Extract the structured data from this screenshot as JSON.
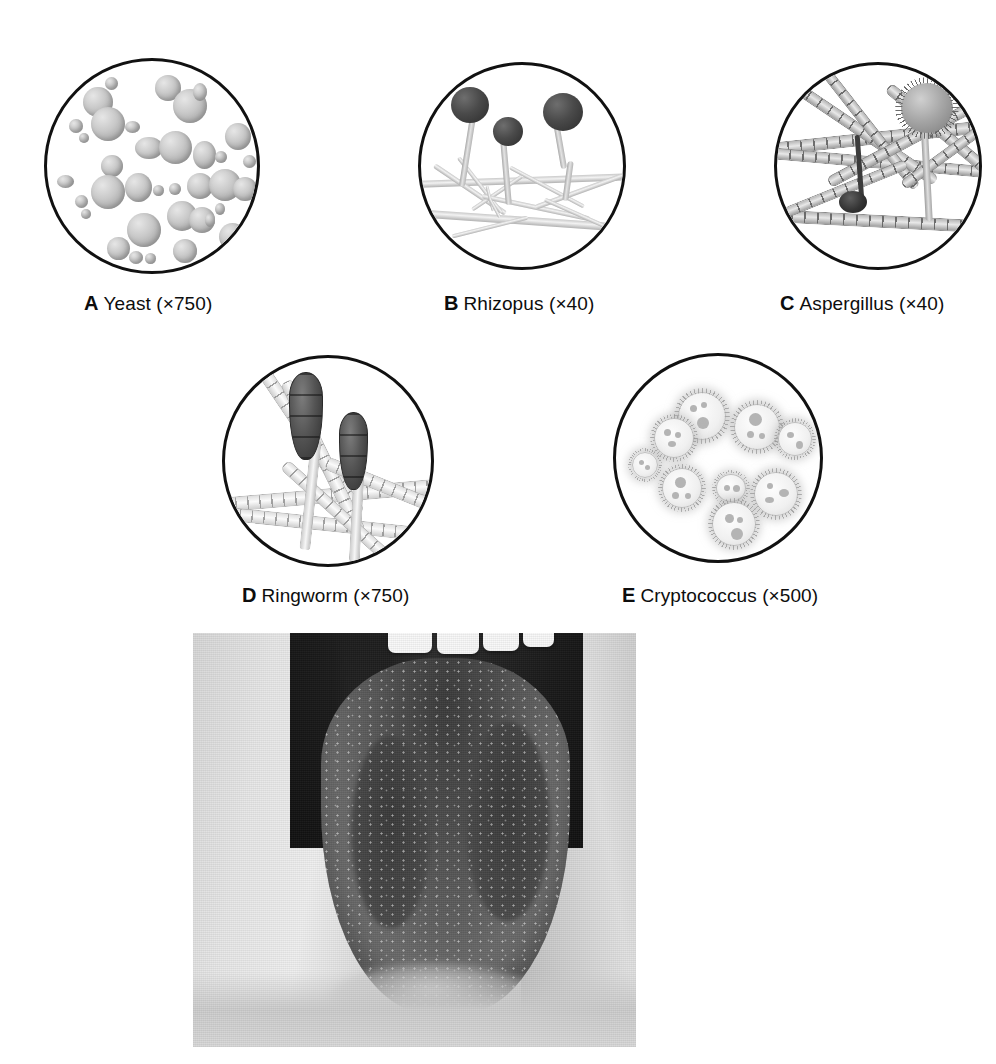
{
  "figure": {
    "kind": "medical-microbiology-plate",
    "panels": [
      {
        "id": "A",
        "tag": "A",
        "name": "Yeast",
        "magnification": "(×750)",
        "subject": "budding-yeast-cells",
        "description": "Round to ovoid grey yeast cells of varied size scattered on a pale field, several joined as budding pairs.",
        "icon": "microscope-field-icon"
      },
      {
        "id": "B",
        "tag": "B",
        "name": "Rhizopus",
        "magnification": "(×40)",
        "subject": "sporangia-on-sporangiophores",
        "description": "Three dark round sporangia borne on upright sporangiophores arising from horizontal stolons with branching rhizoids.",
        "icon": "microscope-field-icon"
      },
      {
        "id": "C",
        "tag": "C",
        "name": "Aspergillus",
        "magnification": "(×40)",
        "subject": "septate-hyphae-with-conidial-head",
        "description": "Interwoven septate (segmented) hyphae with a spiky radiate conidial head on a conidiophore at upper right and a small dark conidium at centre.",
        "icon": "microscope-field-icon"
      },
      {
        "id": "D",
        "tag": "D",
        "name": "Ringworm",
        "magnification": "(×750)",
        "subject": "macroconidia-on-hyphae",
        "description": "Two dark club-shaped multicellular macroconidia on slender stalks rising from pale septate hyphae.",
        "icon": "microscope-field-icon"
      },
      {
        "id": "E",
        "tag": "E",
        "name": "Cryptococcus",
        "magnification": "(×500)",
        "subject": "encapsulated-yeast-cells",
        "description": "Pale encapsulated yeast cells surrounded by fuzzy halo-like capsules, each with granular internal inclusions; some in budding pairs.",
        "icon": "microscope-field-icon"
      }
    ],
    "photograph": {
      "id": "photo",
      "subject": "oral-cavity-tongue",
      "description": "Grayscale clinical photograph of an open mouth with the tongue protruded, showing upper incisors, dark oral cavity, and a speckled white-patched tongue surface.",
      "tooth_count": 4,
      "caption": ""
    }
  },
  "colors": {
    "background": "#ffffff",
    "ink": "#111111",
    "circle_outline": "#111111",
    "cell_grey": "#c9c9c9",
    "dark_spore": "#2b2b2b",
    "photo_mid": "#6a6a6a"
  }
}
